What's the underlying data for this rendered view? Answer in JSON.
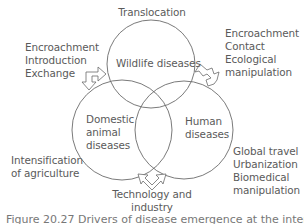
{
  "diagram": {
    "type": "venn",
    "circles": [
      {
        "id": "wildlife",
        "label": "Wildlife diseases",
        "cx": 151,
        "cy": 64,
        "r": 44
      },
      {
        "id": "domestic",
        "label_lines": [
          "Domestic",
          "animal",
          "diseases"
        ],
        "cx": 122,
        "cy": 130,
        "r": 50
      },
      {
        "id": "human",
        "label_lines": [
          "Human",
          "diseases"
        ],
        "cx": 184,
        "cy": 130,
        "r": 49
      }
    ],
    "drivers": {
      "top": {
        "lines": [
          "Translocation"
        ]
      },
      "top_left": {
        "lines": [
          "Encroachment",
          "Introduction",
          "Exchange"
        ]
      },
      "top_right": {
        "lines": [
          "Encroachment",
          "Contact",
          "Ecological",
          "manipulation"
        ]
      },
      "left": {
        "lines": [
          "Intensification",
          "of agriculture"
        ]
      },
      "bottom": {
        "lines": [
          "Technology and",
          "industry"
        ]
      },
      "right": {
        "lines": [
          "Global travel",
          "Urbanization",
          "Biomedical",
          "manipulation"
        ]
      }
    },
    "line_color": "#6b6b6b",
    "text_color": "#5a5a5a"
  },
  "caption": {
    "text": "Figure 20.27 Drivers of disease emergence at the interfaces"
  }
}
